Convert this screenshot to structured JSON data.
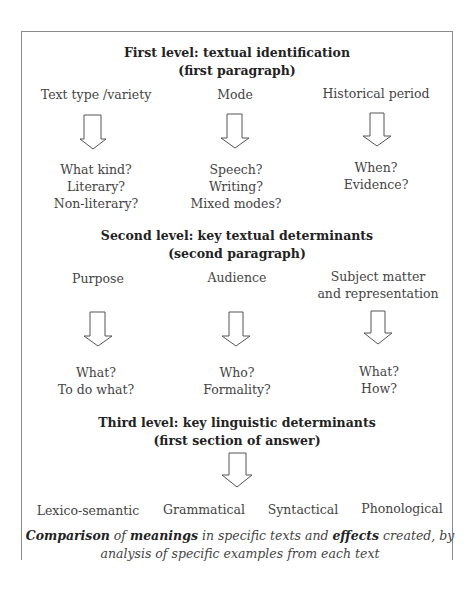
{
  "levels": [
    {
      "title_line1": "First level: textual identification",
      "title_line2": "(first paragraph)",
      "columns": [
        {
          "label": "Text type /variety",
          "questions": [
            "What kind?",
            "Literary?",
            "Non-literary?"
          ]
        },
        {
          "label": "Mode",
          "questions": [
            "Speech?",
            "Writing?",
            "Mixed modes?"
          ]
        },
        {
          "label": "Historical period",
          "questions": [
            "When?",
            "Evidence?"
          ]
        }
      ]
    },
    {
      "title_line1": "Second level: key textual determinants",
      "title_line2": "(second paragraph)",
      "columns": [
        {
          "label": "Purpose",
          "questions": [
            "What?",
            "To do what?"
          ]
        },
        {
          "label": "Audience",
          "questions": [
            "Who?",
            "Formality?"
          ]
        },
        {
          "label_line1": "Subject matter",
          "label_line2": "and representation",
          "questions": [
            "What?",
            "How?"
          ]
        }
      ]
    },
    {
      "title_line1": "Third level: key linguistic determinants",
      "title_line2": "(first section of answer)",
      "categories": [
        "Lexico-semantic",
        "Grammatical",
        "Syntactical",
        "Phonological"
      ]
    }
  ],
  "footer": {
    "w1": "Comparison",
    "w2": " of ",
    "w3": "meanings",
    "w4": " in specific texts and ",
    "w5": "effects",
    "w6": " created, by",
    "line2": "analysis of specific examples from each text"
  },
  "icons": {
    "arrow": "down-arrow-outline-icon"
  }
}
